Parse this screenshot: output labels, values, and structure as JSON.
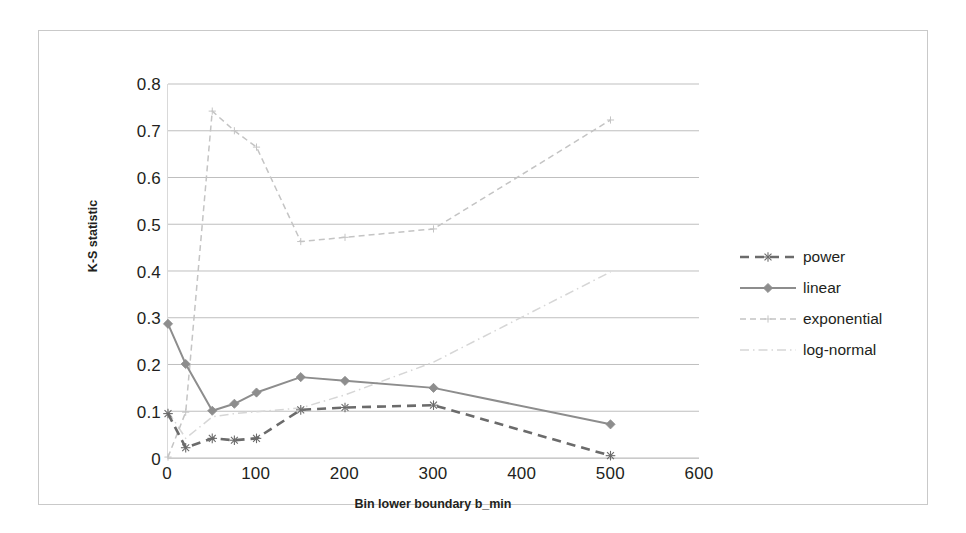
{
  "chart_data": {
    "type": "line",
    "title": "",
    "xlabel": "Bin lower boundary b_min",
    "ylabel": "K-S statistic",
    "xlim": [
      0,
      600
    ],
    "ylim": [
      0,
      0.8
    ],
    "xticks": [
      "0",
      "100",
      "200",
      "300",
      "400",
      "500",
      "600"
    ],
    "xtick_values": [
      0,
      100,
      200,
      300,
      400,
      500,
      600
    ],
    "yticks": [
      "0",
      "0.1",
      "0.2",
      "0.3",
      "0.4",
      "0.5",
      "0.6",
      "0.7",
      "0.8"
    ],
    "ytick_values": [
      0,
      0.1,
      0.2,
      0.3,
      0.4,
      0.5,
      0.6,
      0.7,
      0.8
    ],
    "grid": "horizontal",
    "legend_position": "right",
    "x": [
      0,
      20,
      50,
      75,
      100,
      150,
      200,
      300,
      500
    ],
    "series": [
      {
        "name": "power",
        "color": "#6b6b6b",
        "style": "dashed",
        "marker": "asterisk",
        "values": [
          0.095,
          0.022,
          0.042,
          0.038,
          0.042,
          0.103,
          0.108,
          0.113,
          0.005
        ]
      },
      {
        "name": "linear",
        "color": "#8d8d8d",
        "style": "solid",
        "marker": "diamond",
        "values": [
          0.287,
          0.201,
          0.101,
          0.116,
          0.14,
          0.173,
          0.165,
          0.15,
          0.072
        ]
      },
      {
        "name": "exponential",
        "color": "#c4c4c4",
        "style": "dashed",
        "marker": "plus",
        "values": [
          0.002,
          0.098,
          0.742,
          0.7,
          0.665,
          0.463,
          0.472,
          0.49,
          0.723
        ]
      },
      {
        "name": "log-normal",
        "color": "#d6d6d6",
        "style": "dashdot",
        "marker": "none",
        "values": [
          0.1,
          0.042,
          0.088,
          0.095,
          0.099,
          0.107,
          0.135,
          0.205,
          0.398
        ]
      }
    ]
  },
  "legend": {
    "items": [
      {
        "label": "power"
      },
      {
        "label": "linear"
      },
      {
        "label": "exponential"
      },
      {
        "label": "log-normal"
      }
    ]
  }
}
